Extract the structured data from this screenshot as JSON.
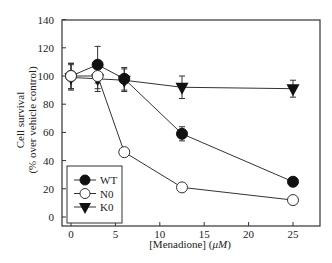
{
  "chart_data": {
    "type": "line",
    "title": "",
    "xlabel": "[Menadione] (μM)",
    "xlabel_parts": {
      "prefix": "[Menadione] (",
      "unit": "μM",
      "suffix": ")"
    },
    "ylabel": "Cell survival",
    "ylabel_sub": "(% over vehicle control)",
    "xlim": [
      -1,
      27
    ],
    "ylim": [
      0,
      140
    ],
    "xticks": [
      0,
      5,
      10,
      15,
      20,
      25
    ],
    "yticks": [
      0,
      20,
      40,
      60,
      80,
      100,
      120,
      140
    ],
    "grid": false,
    "legend_position": "lower-left inside",
    "x": [
      0,
      3,
      6,
      12.5,
      25
    ],
    "series": [
      {
        "name": "WT",
        "marker": "filled-circle",
        "values": [
          100,
          108,
          98,
          59,
          25
        ],
        "err": [
          9,
          13,
          8,
          5,
          3
        ]
      },
      {
        "name": "N0",
        "marker": "open-circle",
        "values": [
          100,
          100,
          46,
          21,
          12
        ],
        "err": [
          9,
          9,
          2,
          1,
          1
        ]
      },
      {
        "name": "K0",
        "marker": "filled-triangle-down",
        "values": [
          99,
          98,
          97,
          92,
          91
        ],
        "err": [
          9,
          9,
          8,
          8,
          6
        ]
      }
    ]
  }
}
